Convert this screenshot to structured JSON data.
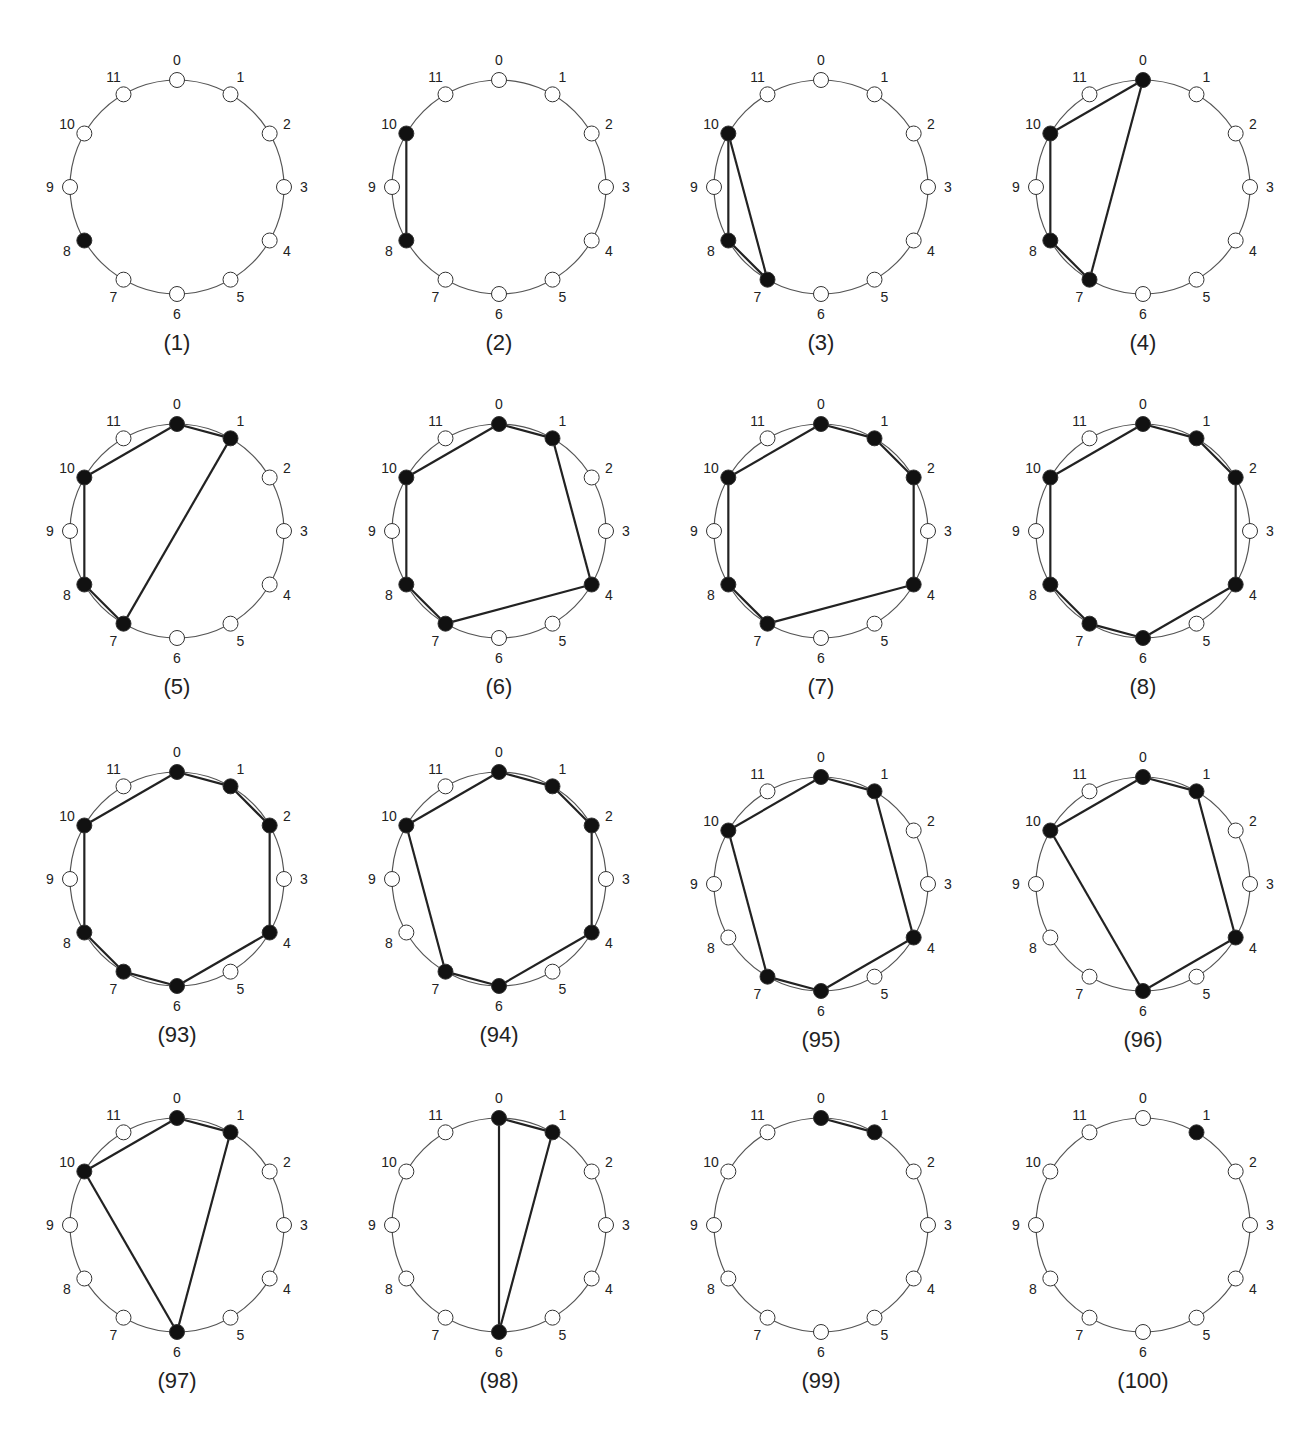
{
  "figure": {
    "node_count": 12,
    "node_labels": [
      "0",
      "1",
      "2",
      "3",
      "4",
      "5",
      "6",
      "7",
      "8",
      "9",
      "10",
      "11"
    ],
    "colors": {
      "filled": "#111111",
      "empty": "#ffffff",
      "edge": "#222222",
      "ring": "#555555"
    },
    "panels": [
      {
        "caption": "(1)",
        "filled": [
          8
        ],
        "edges": []
      },
      {
        "caption": "(2)",
        "filled": [
          8,
          10
        ],
        "edges": [
          [
            10,
            8
          ]
        ]
      },
      {
        "caption": "(3)",
        "filled": [
          7,
          8,
          10
        ],
        "edges": [
          [
            10,
            8
          ],
          [
            8,
            7
          ],
          [
            7,
            10
          ]
        ]
      },
      {
        "caption": "(4)",
        "filled": [
          0,
          7,
          8,
          10
        ],
        "edges": [
          [
            0,
            10
          ],
          [
            10,
            8
          ],
          [
            8,
            7
          ],
          [
            7,
            0
          ]
        ]
      },
      {
        "caption": "(5)",
        "filled": [
          0,
          1,
          7,
          8,
          10
        ],
        "edges": [
          [
            0,
            1
          ],
          [
            1,
            7
          ],
          [
            7,
            8
          ],
          [
            8,
            10
          ],
          [
            10,
            0
          ]
        ]
      },
      {
        "caption": "(6)",
        "filled": [
          0,
          1,
          4,
          7,
          8,
          10
        ],
        "edges": [
          [
            0,
            1
          ],
          [
            1,
            4
          ],
          [
            4,
            7
          ],
          [
            7,
            8
          ],
          [
            8,
            10
          ],
          [
            10,
            0
          ]
        ]
      },
      {
        "caption": "(7)",
        "filled": [
          0,
          1,
          2,
          4,
          7,
          8,
          10
        ],
        "edges": [
          [
            0,
            1
          ],
          [
            1,
            2
          ],
          [
            2,
            4
          ],
          [
            4,
            7
          ],
          [
            7,
            8
          ],
          [
            8,
            10
          ],
          [
            10,
            0
          ]
        ]
      },
      {
        "caption": "(8)",
        "filled": [
          0,
          1,
          2,
          4,
          6,
          7,
          8,
          10
        ],
        "edges": [
          [
            0,
            1
          ],
          [
            1,
            2
          ],
          [
            2,
            4
          ],
          [
            4,
            6
          ],
          [
            6,
            7
          ],
          [
            7,
            8
          ],
          [
            8,
            10
          ],
          [
            10,
            0
          ]
        ]
      },
      {
        "caption": "(93)",
        "filled": [
          0,
          1,
          2,
          4,
          6,
          7,
          8,
          10
        ],
        "edges": [
          [
            0,
            1
          ],
          [
            1,
            2
          ],
          [
            2,
            4
          ],
          [
            4,
            6
          ],
          [
            6,
            7
          ],
          [
            7,
            8
          ],
          [
            8,
            10
          ],
          [
            10,
            0
          ]
        ]
      },
      {
        "caption": "(94)",
        "filled": [
          0,
          1,
          2,
          4,
          6,
          7,
          10
        ],
        "edges": [
          [
            0,
            1
          ],
          [
            1,
            2
          ],
          [
            2,
            4
          ],
          [
            4,
            6
          ],
          [
            6,
            7
          ],
          [
            7,
            10
          ],
          [
            10,
            0
          ]
        ]
      },
      {
        "caption": "(95)",
        "filled": [
          0,
          1,
          4,
          6,
          7,
          10
        ],
        "edges": [
          [
            0,
            1
          ],
          [
            1,
            4
          ],
          [
            4,
            6
          ],
          [
            6,
            7
          ],
          [
            7,
            10
          ],
          [
            10,
            0
          ]
        ]
      },
      {
        "caption": "(96)",
        "filled": [
          0,
          1,
          4,
          6,
          10
        ],
        "edges": [
          [
            0,
            1
          ],
          [
            1,
            4
          ],
          [
            4,
            6
          ],
          [
            6,
            10
          ],
          [
            10,
            0
          ]
        ]
      },
      {
        "caption": "(97)",
        "filled": [
          0,
          1,
          6,
          10
        ],
        "edges": [
          [
            0,
            1
          ],
          [
            1,
            6
          ],
          [
            6,
            10
          ],
          [
            10,
            0
          ]
        ]
      },
      {
        "caption": "(98)",
        "filled": [
          0,
          1,
          6
        ],
        "edges": [
          [
            0,
            1
          ],
          [
            1,
            6
          ],
          [
            6,
            0
          ]
        ]
      },
      {
        "caption": "(99)",
        "filled": [
          0,
          1
        ],
        "edges": [
          [
            0,
            1
          ]
        ]
      },
      {
        "caption": "(100)",
        "filled": [
          1
        ],
        "edges": []
      }
    ]
  }
}
